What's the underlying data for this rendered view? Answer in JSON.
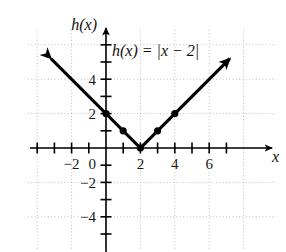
{
  "figure": {
    "name": "absolute-value-function-graph"
  },
  "chart_data": {
    "type": "line",
    "title": "",
    "equation_label": "h(x) = |x − 2|",
    "xlabel": "x",
    "ylabel": "h(x)",
    "xlim": [
      -4.5,
      8.4
    ],
    "ylim": [
      -5.8,
      6.4
    ],
    "xticks": [
      -4,
      -3,
      -2,
      -1,
      0,
      1,
      2,
      3,
      4,
      5,
      6,
      7
    ],
    "yticks": [
      -5,
      -4,
      -3,
      -2,
      -1,
      0,
      1,
      2,
      3,
      4,
      5,
      6
    ],
    "xtick_labels": [
      {
        "value": -2,
        "text": "−2"
      },
      {
        "value": 0,
        "text": "0"
      },
      {
        "value": 2,
        "text": "2"
      },
      {
        "value": 4,
        "text": "4"
      },
      {
        "value": 6,
        "text": "6"
      }
    ],
    "ytick_labels": [
      {
        "value": 4,
        "text": "4"
      },
      {
        "value": 2,
        "text": "2"
      },
      {
        "value": -2,
        "text": "−2"
      },
      {
        "value": -4,
        "text": "−4"
      }
    ],
    "grid": true,
    "grid_style": "dotted",
    "grid_spacing": 2,
    "legend": "none",
    "series": [
      {
        "name": "h(x) = |x − 2|",
        "vertex": [
          2,
          0
        ],
        "x": [
          -3.2,
          2,
          7.2
        ],
        "y": [
          5.2,
          0,
          5.2
        ],
        "arrow_start": true,
        "arrow_end": true,
        "color": "#000000"
      }
    ],
    "points": [
      {
        "x": 0,
        "y": 2
      },
      {
        "x": 1,
        "y": 1
      },
      {
        "x": 2,
        "y": 0
      },
      {
        "x": 3,
        "y": 1
      },
      {
        "x": 4,
        "y": 2
      }
    ],
    "axis_color": "#000000",
    "grid_color": "#b8b8b8"
  }
}
